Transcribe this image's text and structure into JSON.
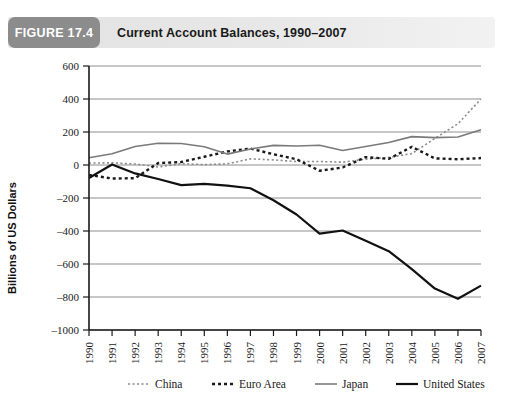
{
  "figure": {
    "badge": "FIGURE 17.4",
    "title": "Current Account Balances, 1990–2007"
  },
  "chart_data": {
    "type": "line",
    "title": "Current Account Balances, 1990–2007",
    "xlabel": "",
    "ylabel": "Billions of US Dollars",
    "ylim": [
      -1000,
      600
    ],
    "ytick_step": 200,
    "yticks": [
      "600",
      "400",
      "200",
      "0",
      "-200",
      "-400",
      "-600",
      "-800",
      "-1000"
    ],
    "grid": "horizontal",
    "legend_position": "bottom",
    "categories": [
      "1990",
      "1991",
      "1992",
      "1993",
      "1994",
      "1995",
      "1996",
      "1997",
      "1998",
      "1999",
      "2000",
      "2001",
      "2002",
      "2003",
      "2004",
      "2005",
      "2006",
      "2007"
    ],
    "series": [
      {
        "name": "China",
        "style": "dotted",
        "color": "#8c8c8c",
        "width": 1.6,
        "values": [
          12,
          13,
          6,
          -12,
          8,
          2,
          7,
          37,
          31,
          21,
          21,
          17,
          35,
          46,
          69,
          161,
          250,
          400
        ]
      },
      {
        "name": "Euro Area",
        "style": "dashed",
        "color": "#1a1a1a",
        "width": 2.4,
        "values": [
          -60,
          -82,
          -80,
          12,
          18,
          50,
          82,
          100,
          65,
          35,
          -35,
          -15,
          48,
          37,
          110,
          40,
          35,
          42
        ]
      },
      {
        "name": "Japan",
        "style": "solid",
        "color": "#7a7a7a",
        "width": 1.6,
        "values": [
          44,
          68,
          112,
          132,
          130,
          111,
          66,
          97,
          119,
          115,
          120,
          88,
          112,
          136,
          172,
          166,
          170,
          213
        ]
      },
      {
        "name": "United States",
        "style": "solid",
        "color": "#111111",
        "width": 2.2,
        "values": [
          -79,
          3,
          -51,
          -85,
          -122,
          -114,
          -125,
          -141,
          -214,
          -300,
          -416,
          -397,
          -459,
          -522,
          -631,
          -749,
          -811,
          -731
        ]
      }
    ]
  },
  "legend": [
    {
      "label": "China"
    },
    {
      "label": "Euro Area"
    },
    {
      "label": "Japan"
    },
    {
      "label": "United States"
    }
  ]
}
